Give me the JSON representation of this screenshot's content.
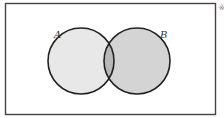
{
  "diagram": {
    "type": "venn",
    "universal_set_label": "𝒰",
    "sets": [
      {
        "name": "A",
        "label": "A",
        "fill": "#e8e8e8"
      },
      {
        "name": "B",
        "label": "B",
        "fill": "#d4d4d4"
      }
    ],
    "intersection_fill": "#b8b8b8",
    "stroke_color": "#222222",
    "background": "#ffffff"
  }
}
